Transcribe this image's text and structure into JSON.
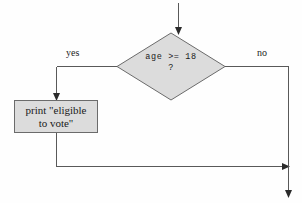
{
  "diagram": {
    "type": "flowchart",
    "colors": {
      "background": "#fefefe",
      "node_fill": "#dcdcdc",
      "node_stroke": "#6b6b6b",
      "line": "#595959",
      "arrow": "#2b2b2b",
      "text": "#1a1a1a"
    },
    "nodes": {
      "decision": {
        "shape": "diamond",
        "line1": "age >= 18",
        "line2": "?"
      },
      "process": {
        "shape": "rectangle",
        "line1": "print \"eligible",
        "line2": "to vote\""
      }
    },
    "edges": {
      "yes_label": "yes",
      "no_label": "no"
    }
  }
}
